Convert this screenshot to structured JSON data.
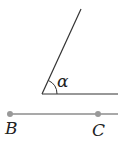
{
  "diagram": {
    "angle_label": "α",
    "point_b_label": "B",
    "point_c_label": "C",
    "line_color": "#333333",
    "point_color": "#999999"
  }
}
